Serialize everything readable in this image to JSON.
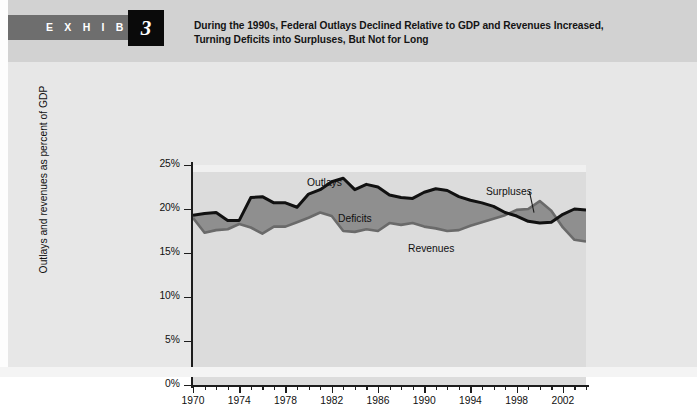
{
  "exhibit": {
    "kicker": "E X H I B I T",
    "number": "3",
    "title": "During the 1990s, Federal Outlays Declined Relative to GDP and Revenues Increased, Turning Deficits into Surpluses, But Not for Long"
  },
  "labels": {
    "outlays": "Outlays",
    "deficits": "Deficits",
    "revenues": "Revenues",
    "surpluses": "Surpluses"
  },
  "colors": {
    "exhibit_bar": "#6e6e6e",
    "exhibit_number_box": "#0a0a0a",
    "header_band": "#d2d2d2",
    "chart_background": "#e7e7e7",
    "plot_background": "#dcdcdc",
    "area_fill": "#8f8f8f",
    "outlays_line": "#111111",
    "revenues_line": "#6a6a6a",
    "axis": "#1d1d1d",
    "footer_rule": "#595959"
  },
  "chart_data": {
    "type": "area",
    "title": "During the 1990s, Federal Outlays Declined Relative to GDP and Revenues Increased, Turning Deficits into Surpluses, But Not for Long",
    "xlabel": "",
    "ylabel": "Outlays and revenues as percent of GDP",
    "xlim": [
      1970,
      2004
    ],
    "ylim": [
      0,
      25
    ],
    "ytick_labels": [
      "25%",
      "20%",
      "15%",
      "10%",
      "5%",
      "0%"
    ],
    "ytick_values": [
      25,
      20,
      15,
      10,
      5,
      0
    ],
    "xtick_labels": [
      "1970",
      "1974",
      "1978",
      "1982",
      "1986",
      "1990",
      "1994",
      "1998",
      "2002"
    ],
    "xtick_values": [
      1970,
      1974,
      1978,
      1982,
      1986,
      1990,
      1994,
      1998,
      2002
    ],
    "xtick_minor_step": 1,
    "grid": false,
    "legend_position": "inline-annotations",
    "annotations": [
      {
        "text": "Outlays",
        "x": 1980,
        "y": 24.2
      },
      {
        "text": "Deficits",
        "x": 1982,
        "y": 19.8
      },
      {
        "text": "Revenues",
        "x": 1989,
        "y": 16.3
      },
      {
        "text": "Surpluses",
        "x": 1998,
        "y": 23.0
      }
    ],
    "x": [
      1970,
      1971,
      1972,
      1973,
      1974,
      1975,
      1976,
      1977,
      1978,
      1979,
      1980,
      1981,
      1982,
      1983,
      1984,
      1985,
      1986,
      1987,
      1988,
      1989,
      1990,
      1991,
      1992,
      1993,
      1994,
      1995,
      1996,
      1997,
      1998,
      1999,
      2000,
      2001,
      2002,
      2003,
      2004
    ],
    "series": [
      {
        "name": "Outlays",
        "values": [
          19.3,
          19.5,
          19.6,
          18.7,
          18.7,
          21.3,
          21.4,
          20.7,
          20.7,
          20.2,
          21.7,
          22.2,
          23.1,
          23.5,
          22.2,
          22.8,
          22.5,
          21.6,
          21.3,
          21.2,
          21.9,
          22.3,
          22.1,
          21.4,
          21.0,
          20.7,
          20.3,
          19.6,
          19.2,
          18.6,
          18.4,
          18.5,
          19.4,
          20.0,
          19.9
        ]
      },
      {
        "name": "Revenues",
        "values": [
          19.0,
          17.3,
          17.6,
          17.7,
          18.3,
          17.9,
          17.2,
          18.0,
          18.0,
          18.5,
          19.0,
          19.6,
          19.2,
          17.5,
          17.4,
          17.7,
          17.5,
          18.4,
          18.2,
          18.4,
          18.0,
          17.8,
          17.5,
          17.6,
          18.1,
          18.5,
          18.9,
          19.3,
          19.9,
          20.0,
          20.9,
          19.8,
          17.9,
          16.5,
          16.3
        ]
      }
    ],
    "regions": [
      {
        "name": "Deficits",
        "description": "Shaded area where Outlays exceed Revenues, 1970-1997 and 2002-2004",
        "fill": "#8f8f8f"
      },
      {
        "name": "Surpluses",
        "description": "Shaded area where Revenues exceed Outlays, 1998-2001",
        "fill": "#8f8f8f"
      }
    ]
  }
}
